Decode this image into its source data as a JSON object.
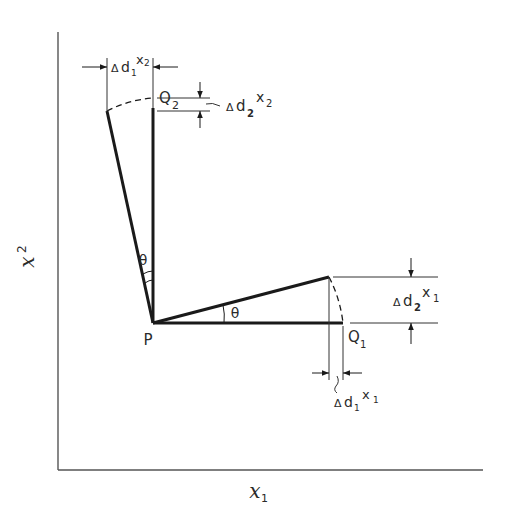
{
  "diagram": {
    "type": "geometric-rotation-diagram",
    "axes": {
      "x_label": "x",
      "x_label_sub": "1",
      "y_label": "x",
      "y_label_sub": "2"
    },
    "points": {
      "origin": "P",
      "q1": "Q",
      "q1_sub": "1",
      "q2": "Q",
      "q2_sub": "2"
    },
    "angles": {
      "upper": "θ",
      "lower": "θ"
    },
    "dimensions": {
      "top_horizontal": {
        "delta": "Δ",
        "d": "d",
        "d_sub": "1",
        "var": "x",
        "var_sub": "2"
      },
      "top_vertical": {
        "delta": "Δ",
        "d": "d",
        "d_sub": "2",
        "var": "x",
        "var_sub": "2"
      },
      "right_vertical": {
        "delta": "Δ",
        "d": "d",
        "d_sub": "2",
        "var": "x",
        "var_sub": "1"
      },
      "bottom_horizontal": {
        "delta": "Δ",
        "d": "d",
        "d_sub": "1",
        "var": "x",
        "var_sub": "1"
      }
    },
    "colors": {
      "line": "#1a1a1a",
      "axis": "#555555",
      "background": "#ffffff"
    }
  }
}
